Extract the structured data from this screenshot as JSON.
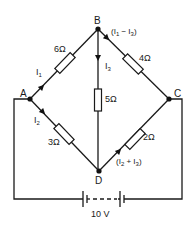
{
  "diagram": {
    "type": "wheatstone-bridge-circuit",
    "nodes": {
      "A": {
        "label": "A"
      },
      "B": {
        "label": "B"
      },
      "C": {
        "label": "C"
      },
      "D": {
        "label": "D"
      }
    },
    "resistors": {
      "AB": {
        "label": "6Ω",
        "value_ohms": 6
      },
      "BC": {
        "label": "4Ω",
        "value_ohms": 4
      },
      "BD": {
        "label": "5Ω",
        "value_ohms": 5
      },
      "AD": {
        "label": "3Ω",
        "value_ohms": 3
      },
      "DC": {
        "label": "2Ω",
        "value_ohms": 2
      }
    },
    "currents": {
      "AB": {
        "label": "I1",
        "main": "I",
        "sub": "1"
      },
      "AD": {
        "label": "I2",
        "main": "I",
        "sub": "2"
      },
      "BD": {
        "label": "I3",
        "main": "I",
        "sub": "3"
      },
      "BC": {
        "label": "(I1 − I3)",
        "open": "(I",
        "sub1": "1",
        "mid": " − I",
        "sub2": "3",
        "close": ")"
      },
      "DC": {
        "label": "(I2 + I3)",
        "open": "(I",
        "sub1": "2",
        "mid": " + I",
        "sub2": "3",
        "close": ")"
      }
    },
    "source": {
      "label": "10 V",
      "value_volts": 10
    }
  }
}
